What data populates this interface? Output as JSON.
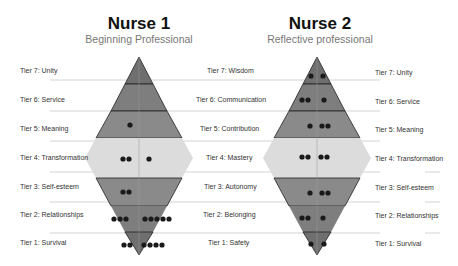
{
  "nurse1": {
    "title": "Nurse 1",
    "subtitle": "Beginning Professional",
    "dots": [
      {
        "tier": 7,
        "left": 0,
        "right": 0
      },
      {
        "tier": 6,
        "left": 0,
        "right": 0
      },
      {
        "tier": 5,
        "left": 1,
        "right": 0
      },
      {
        "tier": 4,
        "left": 2,
        "right": 1
      },
      {
        "tier": 3,
        "left": 2,
        "right": 0
      },
      {
        "tier": 2,
        "left": 3,
        "right": 5
      },
      {
        "tier": 1,
        "left": 2,
        "right": 4
      }
    ]
  },
  "nurse2": {
    "title": "Nurse 2",
    "subtitle": "Reflective professional",
    "dots": [
      {
        "tier": 7,
        "left": 1,
        "right": 1
      },
      {
        "tier": 6,
        "left": 2,
        "right": 1
      },
      {
        "tier": 5,
        "left": 1,
        "right": 2
      },
      {
        "tier": 4,
        "left": 2,
        "right": 2
      },
      {
        "tier": 3,
        "left": 1,
        "right": 2
      },
      {
        "tier": 2,
        "left": 2,
        "right": 1
      },
      {
        "tier": 1,
        "left": 1,
        "right": 1
      }
    ]
  },
  "left_labels": [
    "Tier 7: Unity",
    "Tier 6: Service",
    "Tier 5: Meaning",
    "Tier 4: Transformation",
    "Tier 3: Self-esteem",
    "Tier 2: Relationships",
    "Tier 1: Survival"
  ],
  "center_labels": [
    "Tier 7: Wisdom",
    "Tier 6: Communication",
    "Tier 5: Contribution",
    "Tier 4: Mastery",
    "Tier 3: Autonomy",
    "Tier 2: Belonging",
    "Tier 1: Safety"
  ],
  "right_labels": [
    "Tier 7: Unity",
    "Tier 6: Service",
    "Tier 5: Meaning",
    "Tier 4: Transformation",
    "Tier 3: Self-esteem",
    "Tier 2: Relationships",
    "Tier 1: Survival"
  ],
  "colors": {
    "tier_dark": "#6f6f6f",
    "tier_mid": "#8a8a8a",
    "tier4_light": "#dcdcdc",
    "outline": "#222222",
    "dot": "#1a1a1a",
    "line": "#c8c8c8"
  }
}
